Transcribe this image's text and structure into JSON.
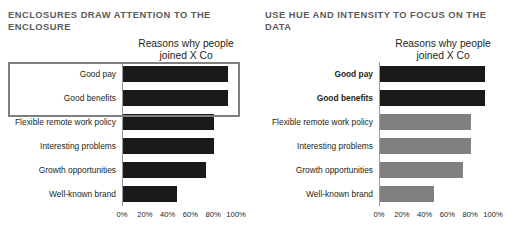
{
  "panels": [
    {
      "id": "left",
      "title": "ENCLOSURES DRAW ATTENTION TO THE ENCLOSURE",
      "has_enclosure": true,
      "chart_data": {
        "type": "bar",
        "orientation": "horizontal",
        "title": "Reasons why people joined X Co",
        "title_line1": "Reasons why people",
        "title_line2": "joined X Co",
        "xlabel": "",
        "ylabel": "",
        "xlim": [
          0,
          100
        ],
        "grid": false,
        "legend": "none",
        "tick_labels": [
          "0%",
          "20%",
          "40%",
          "60%",
          "80%",
          "100%"
        ],
        "tick_values": [
          0,
          20,
          40,
          60,
          80,
          100
        ],
        "categories": [
          "Good pay",
          "Good benefits",
          "Flexible remote work policy",
          "Interesting problems",
          "Growth opportunities",
          "Well-known brand"
        ],
        "values": [
          92,
          92,
          80,
          80,
          73,
          47
        ],
        "bar_colors": [
          "#1a1a1a",
          "#1a1a1a",
          "#1a1a1a",
          "#1a1a1a",
          "#1a1a1a",
          "#1a1a1a"
        ],
        "label_bold": [
          false,
          false,
          false,
          false,
          false,
          false
        ]
      }
    },
    {
      "id": "right",
      "title": "USE HUE AND INTENSITY TO FOCUS ON THE DATA",
      "has_enclosure": false,
      "chart_data": {
        "type": "bar",
        "orientation": "horizontal",
        "title": "Reasons why people joined X Co",
        "title_line1": "Reasons why people",
        "title_line2": "joined X Co",
        "xlabel": "",
        "ylabel": "",
        "xlim": [
          0,
          100
        ],
        "grid": false,
        "legend": "none",
        "tick_labels": [
          "0%",
          "20%",
          "40%",
          "60%",
          "80%",
          "100%"
        ],
        "tick_values": [
          0,
          20,
          40,
          60,
          80,
          100
        ],
        "categories": [
          "Good pay",
          "Good benefits",
          "Flexible remote work policy",
          "Interesting problems",
          "Growth opportunities",
          "Well-known brand"
        ],
        "values": [
          92,
          92,
          80,
          80,
          73,
          47
        ],
        "bar_colors": [
          "#1a1a1a",
          "#1a1a1a",
          "#808080",
          "#808080",
          "#808080",
          "#808080"
        ],
        "label_bold": [
          true,
          true,
          false,
          false,
          false,
          false
        ]
      }
    }
  ],
  "colors": {
    "background": "#ffffff",
    "heading": "#5b5b5b",
    "text": "#231f20",
    "bar_dark": "#1a1a1a",
    "bar_gray": "#808080",
    "enclosure_border": "#7f7f7f",
    "axis_line": "#9a9a9a"
  }
}
